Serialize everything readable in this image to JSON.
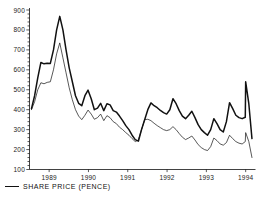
{
  "chart_data": {
    "type": "line",
    "title": "",
    "xlabel": "",
    "ylabel": "",
    "ylim": [
      100,
      900
    ],
    "xlim": [
      1988.5,
      1994.25
    ],
    "grid": false,
    "legend_position": "below-left",
    "y_ticks": [
      100,
      200,
      300,
      400,
      500,
      600,
      700,
      800,
      900
    ],
    "y_tick_labels": [
      "100",
      "200",
      "300",
      "400",
      "500",
      "600",
      "700",
      "800",
      "900"
    ],
    "y_minor_tick_step": 20,
    "x_ticks": [
      1989,
      1990,
      1991,
      1992,
      1993,
      1994
    ],
    "x_tick_labels": [
      "1989",
      "1990",
      "1991",
      "1992",
      "1993",
      "1994"
    ],
    "legend": [
      {
        "label": "SHARE PRICE (PENCE)",
        "color": "#111111",
        "width": 1.6
      }
    ],
    "series": [
      {
        "name": "SHARE PRICE (PENCE)",
        "color": "#111111",
        "width": 1.5,
        "x": [
          1988.55,
          1988.63,
          1988.71,
          1988.79,
          1988.87,
          1988.95,
          1989.03,
          1989.11,
          1989.19,
          1989.27,
          1989.35,
          1989.43,
          1989.51,
          1989.59,
          1989.67,
          1989.75,
          1989.83,
          1989.91,
          1989.99,
          1990.07,
          1990.15,
          1990.23,
          1990.31,
          1990.39,
          1990.47,
          1990.55,
          1990.63,
          1990.71,
          1990.79,
          1990.87,
          1990.95,
          1991.03,
          1991.11,
          1991.19,
          1991.27,
          1991.35,
          1991.43,
          1991.51,
          1991.59,
          1991.67,
          1991.75,
          1991.83,
          1991.91,
          1991.99,
          1992.07,
          1992.15,
          1992.23,
          1992.31,
          1992.39,
          1992.47,
          1992.55,
          1992.63,
          1992.71,
          1992.79,
          1992.87,
          1992.95,
          1993.03,
          1993.11,
          1993.19,
          1993.27,
          1993.35,
          1993.43,
          1993.51,
          1993.59,
          1993.67,
          1993.75,
          1993.83,
          1993.91,
          1993.99
        ],
        "y": [
          405,
          470,
          560,
          637,
          630,
          633,
          632,
          700,
          800,
          868,
          800,
          700,
          610,
          540,
          470,
          432,
          420,
          470,
          498,
          455,
          400,
          408,
          432,
          395,
          430,
          424,
          395,
          388,
          368,
          345,
          320,
          300,
          272,
          250,
          242,
          300,
          350,
          400,
          434,
          420,
          410,
          396,
          385,
          378,
          400,
          455,
          430,
          395,
          368,
          355,
          372,
          392,
          360,
          325,
          300,
          285,
          272,
          300,
          355,
          330,
          300,
          288,
          340,
          435,
          405,
          372,
          360,
          355,
          362
        ]
      },
      {
        "name": "SHARE PRICE (PENCE)",
        "color": "#111111",
        "width": 0.7,
        "x": [
          1988.55,
          1988.63,
          1988.71,
          1988.79,
          1988.87,
          1988.95,
          1989.03,
          1989.11,
          1989.19,
          1989.27,
          1989.35,
          1989.43,
          1989.51,
          1989.59,
          1989.67,
          1989.75,
          1989.83,
          1989.91,
          1989.99,
          1990.07,
          1990.15,
          1990.23,
          1990.31,
          1990.39,
          1990.47,
          1990.55,
          1990.63,
          1990.71,
          1990.79,
          1990.87,
          1990.95,
          1991.03,
          1991.11,
          1991.19,
          1991.27,
          1991.35,
          1991.43,
          1991.51,
          1991.59,
          1991.67,
          1991.75,
          1991.83,
          1991.91,
          1991.99,
          1992.07,
          1992.15,
          1992.23,
          1992.31,
          1992.39,
          1992.47,
          1992.55,
          1992.63,
          1992.71,
          1992.79,
          1992.87,
          1992.95,
          1993.03,
          1993.11,
          1993.19,
          1993.27,
          1993.35,
          1993.43,
          1993.51,
          1993.59,
          1993.67,
          1993.75,
          1993.83,
          1993.91,
          1993.99
        ],
        "y": [
          400,
          440,
          500,
          535,
          530,
          537,
          540,
          600,
          680,
          735,
          660,
          585,
          510,
          450,
          400,
          368,
          350,
          372,
          398,
          378,
          352,
          360,
          378,
          345,
          370,
          360,
          340,
          330,
          312,
          300,
          285,
          272,
          255,
          240,
          248,
          300,
          350,
          352,
          345,
          332,
          320,
          310,
          300,
          295,
          300,
          315,
          300,
          280,
          262,
          250,
          258,
          268,
          248,
          225,
          210,
          200,
          195,
          215,
          258,
          245,
          228,
          222,
          235,
          272,
          255,
          240,
          232,
          228,
          240
        ]
      }
    ],
    "series_tail": {
      "thick": {
        "x": [
          1994.0,
          1994.08,
          1994.16
        ],
        "y": [
          540,
          430,
          255
        ]
      },
      "thin": {
        "x": [
          1994.0,
          1994.08,
          1994.16
        ],
        "y": [
          285,
          240,
          160
        ]
      }
    },
    "late_peak": {
      "thick": {
        "x": [
          1993.99,
          1994.0
        ],
        "y": [
          362,
          540
        ]
      },
      "thin": {
        "x": [
          1993.99,
          1994.0
        ],
        "y": [
          240,
          285
        ]
      }
    }
  }
}
